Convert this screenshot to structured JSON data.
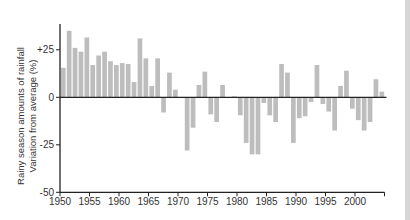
{
  "chart_data": {
    "type": "bar",
    "title": "",
    "xlabel": "",
    "ylabel_line1": "Rainy season amounts of rainfall",
    "ylabel_line2": "Variation from average (%)",
    "ylim": [
      -50,
      50
    ],
    "yticks": [
      {
        "value": 25,
        "label": "+25"
      },
      {
        "value": 0,
        "label": "0"
      },
      {
        "value": -25,
        "label": "-25"
      },
      {
        "value": -50,
        "label": "-50"
      }
    ],
    "xticks": [
      {
        "value": 1950,
        "label": "1950"
      },
      {
        "value": 1955,
        "label": "1955"
      },
      {
        "value": 1960,
        "label": "1960"
      },
      {
        "value": 1965,
        "label": "1965"
      },
      {
        "value": 1970,
        "label": "1970"
      },
      {
        "value": 1975,
        "label": "1975"
      },
      {
        "value": 1980,
        "label": "1980"
      },
      {
        "value": 1985,
        "label": "1985"
      },
      {
        "value": 1990,
        "label": "1990"
      },
      {
        "value": 1995,
        "label": "1995"
      },
      {
        "value": 2000,
        "label": "2000"
      },
      {
        "value": 2005,
        "label": ""
      }
    ],
    "grid": false,
    "bar_color": "#bdbdbd",
    "axis_color": "#222222",
    "categories": [
      1951,
      1952,
      1953,
      1954,
      1955,
      1956,
      1957,
      1958,
      1959,
      1960,
      1961,
      1962,
      1963,
      1964,
      1965,
      1966,
      1967,
      1968,
      1969,
      1970,
      1971,
      1972,
      1973,
      1974,
      1975,
      1976,
      1977,
      1978,
      1979,
      1980,
      1981,
      1982,
      1983,
      1984,
      1985,
      1986,
      1987,
      1988,
      1989,
      1990,
      1991,
      1992,
      1993,
      1994,
      1995,
      1996,
      1997,
      1998,
      1999,
      2000,
      2001,
      2002,
      2003,
      2004,
      2005
    ],
    "values": [
      15.5,
      35,
      26,
      24,
      31.5,
      17,
      22,
      24,
      19,
      17,
      18,
      17.5,
      8,
      31,
      20.5,
      6,
      20.5,
      -8,
      13,
      4,
      0,
      -28,
      -16,
      6.5,
      13.5,
      -9,
      -13,
      6.5,
      0,
      0.5,
      -9.5,
      -24,
      -30,
      -30,
      -3,
      -9.5,
      -13,
      17.5,
      13,
      -24,
      -11,
      -10,
      -2.5,
      17,
      -3.5,
      -7.5,
      -17.5,
      6,
      14,
      -6,
      -12,
      -17.5,
      -13,
      9.5,
      3
    ]
  }
}
